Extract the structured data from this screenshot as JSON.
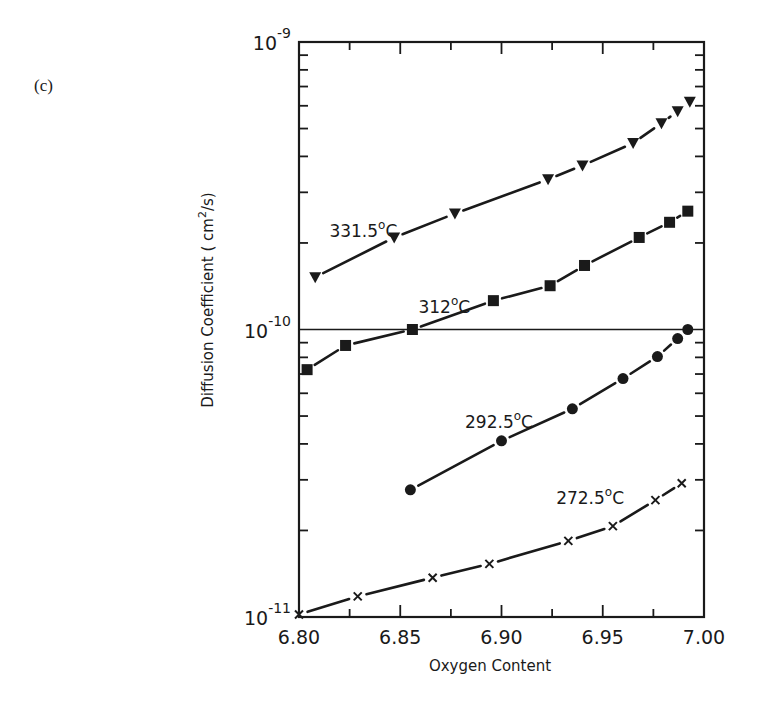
{
  "panel_label": "(c)",
  "chart_data": {
    "type": "line",
    "title": "",
    "xlabel": "Oxygen Content",
    "ylabel": "Diffusion Coefficient ( cm2/s)",
    "ylabel_parts": {
      "main": "Diffusion  Coefficient  ( cm",
      "sup": "2",
      "tail": "/s)"
    },
    "xlim": [
      6.8,
      7.0
    ],
    "ylim": [
      1e-11,
      1e-09
    ],
    "yscale": "log",
    "x_ticks": [
      6.8,
      6.85,
      6.9,
      6.95,
      7.0
    ],
    "x_tick_labels": [
      "6.80",
      "6.85",
      "6.90",
      "6.95",
      "7.00"
    ],
    "y_tick_labels": [
      {
        "value": 1e-09,
        "base": "10",
        "exp": "-9"
      },
      {
        "value": 1e-10,
        "base": "10",
        "exp": "-10"
      },
      {
        "value": 1e-11,
        "base": "10",
        "exp": "-11"
      }
    ],
    "reference_line": {
      "y": 1e-10,
      "style": "horizontal line across plot"
    },
    "grid": false,
    "legend": "inline labels next to curves",
    "series": [
      {
        "name": "331.5°C",
        "marker": "triangle-down",
        "label_pos": {
          "x": 6.815,
          "y": 2.1e-10
        },
        "x": [
          6.808,
          6.847,
          6.877,
          6.923,
          6.94,
          6.965,
          6.979,
          6.987,
          6.993
        ],
        "values": [
          1.52e-10,
          2.09e-10,
          2.53e-10,
          3.33e-10,
          3.72e-10,
          4.45e-10,
          5.22e-10,
          5.74e-10,
          6.2e-10
        ]
      },
      {
        "name": "312°C",
        "marker": "square",
        "label_pos": {
          "x": 6.859,
          "y": 1.14e-10
        },
        "x": [
          6.804,
          6.823,
          6.856,
          6.896,
          6.924,
          6.941,
          6.968,
          6.983,
          6.992
        ],
        "values": [
          7.25e-11,
          8.8e-11,
          1e-10,
          1.26e-10,
          1.42e-10,
          1.67e-10,
          2.09e-10,
          2.36e-10,
          2.58e-10
        ]
      },
      {
        "name": "292.5°C",
        "marker": "circle",
        "label_pos": {
          "x": 6.882,
          "y": 4.55e-11
        },
        "x": [
          6.855,
          6.9,
          6.935,
          6.96,
          6.977,
          6.987,
          6.992
        ],
        "values": [
          2.77e-11,
          4.1e-11,
          5.3e-11,
          6.75e-11,
          8.05e-11,
          9.3e-11,
          1e-10
        ]
      },
      {
        "name": "272.5°C",
        "marker": "x",
        "label_pos": {
          "x": 6.927,
          "y": 2.48e-11
        },
        "x": [
          6.8,
          6.829,
          6.866,
          6.894,
          6.933,
          6.955,
          6.976,
          6.989
        ],
        "values": [
          1.02e-11,
          1.18e-11,
          1.37e-11,
          1.53e-11,
          1.84e-11,
          2.07e-11,
          2.55e-11,
          2.92e-11
        ]
      }
    ]
  }
}
